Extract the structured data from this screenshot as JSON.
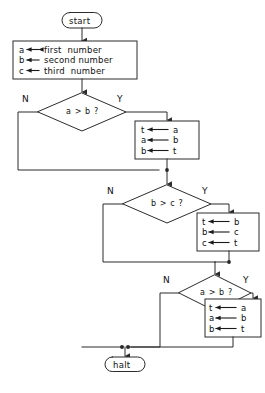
{
  "diagram": {
    "stroke_color": "#2b2b2b",
    "text_color": "#111111",
    "background": "#ffffff"
  },
  "nodes": {
    "start": {
      "label": "start",
      "shape": "terminator"
    },
    "input_box": {
      "shape": "process",
      "lines": [
        {
          "target": "a",
          "arrow": "←",
          "source": "first  number"
        },
        {
          "target": "b",
          "arrow": "←",
          "source": "second number"
        },
        {
          "target": "c",
          "arrow": "←",
          "source": "third  number"
        }
      ]
    },
    "decision1": {
      "label": "a > b ?",
      "shape": "decision",
      "no_label": "N",
      "yes_label": "Y"
    },
    "swap1": {
      "shape": "process",
      "lines": [
        {
          "target": "t",
          "arrow": "←",
          "source": "a"
        },
        {
          "target": "a",
          "arrow": "←",
          "source": "b"
        },
        {
          "target": "b",
          "arrow": "←",
          "source": "t"
        }
      ]
    },
    "decision2": {
      "label": "b > c ?",
      "shape": "decision",
      "no_label": "N",
      "yes_label": "Y"
    },
    "swap2": {
      "shape": "process",
      "lines": [
        {
          "target": "t",
          "arrow": "←",
          "source": "b"
        },
        {
          "target": "b",
          "arrow": "←",
          "source": "c"
        },
        {
          "target": "c",
          "arrow": "←",
          "source": "t"
        }
      ]
    },
    "decision3": {
      "label": "a > b ?",
      "shape": "decision",
      "no_label": "N",
      "yes_label": "Y"
    },
    "swap3": {
      "shape": "process",
      "lines": [
        {
          "target": "t",
          "arrow": "←",
          "source": "a"
        },
        {
          "target": "a",
          "arrow": "←",
          "source": "b"
        },
        {
          "target": "b",
          "arrow": "←",
          "source": "t"
        }
      ]
    },
    "halt": {
      "label": "halt",
      "shape": "terminator"
    }
  },
  "caption": {
    "text": ""
  }
}
